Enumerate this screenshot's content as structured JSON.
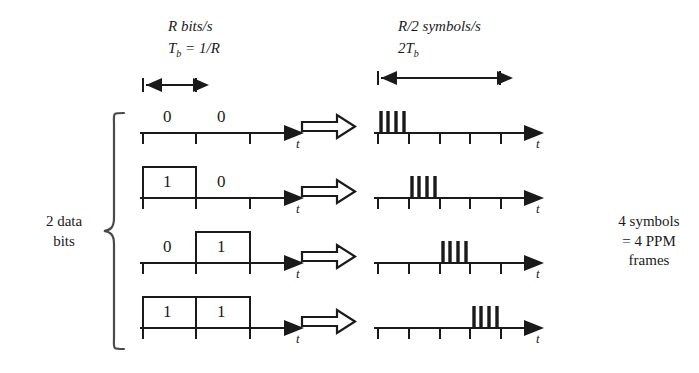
{
  "figure": {
    "title_left": "R bits/s",
    "title_left_2_prefix": "T",
    "title_left_2_sub": "b",
    "title_left_2_rest": " = 1/R",
    "title_right": "R/2 symbols/s",
    "title_right_2_prefix": "2T",
    "title_right_2_sub": "b",
    "left_brace_label": "2 data\nbits",
    "right_brace_label": "4 symbols\n= 4 PPM\nframes",
    "axis_label": "t",
    "transform_arrow": "block-arrow-right"
  },
  "rows": [
    {
      "bits": [
        "0",
        "0"
      ],
      "pulse_first_half": false,
      "pulse_second_half": false,
      "ppm_slot": 1,
      "burst_pulses": 4
    },
    {
      "bits": [
        "1",
        "0"
      ],
      "pulse_first_half": true,
      "pulse_second_half": false,
      "ppm_slot": 2,
      "burst_pulses": 4
    },
    {
      "bits": [
        "0",
        "1"
      ],
      "pulse_first_half": false,
      "pulse_second_half": true,
      "ppm_slot": 3,
      "burst_pulses": 4
    },
    {
      "bits": [
        "1",
        "1"
      ],
      "pulse_first_half": true,
      "pulse_second_half": true,
      "ppm_slot": 4,
      "burst_pulses": 4
    }
  ],
  "geometry": {
    "left_axis_x0": 140,
    "left_axis_x1": 292,
    "left_tick_xs": [
      143,
      196,
      250
    ],
    "right_axis_x0": 374,
    "right_axis_x1": 532,
    "right_tick_xs": [
      378,
      409,
      440,
      470,
      501
    ],
    "row_baseline_ys": [
      133,
      198,
      263,
      328
    ],
    "tb_bar": [
      143,
      196
    ],
    "two_tb_bar": [
      378,
      500
    ]
  },
  "colors": {
    "ink": "#1a1a1a",
    "background": "#ffffff"
  }
}
